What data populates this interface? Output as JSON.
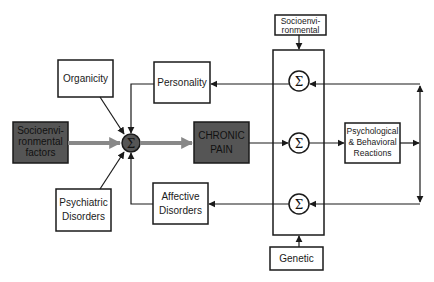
{
  "diagram": {
    "type": "block-diagram",
    "colors": {
      "background": "#ffffff",
      "line": "#1a1a1a",
      "dark_box_fill": "#555555",
      "thick_arrow": "#888888"
    },
    "nodes": {
      "organicity": {
        "lines": [
          "Organicity"
        ]
      },
      "socio_factors": {
        "lines": [
          "Socioenvi-",
          "ronmental",
          "factors"
        ]
      },
      "psychiatric": {
        "lines": [
          "Psychiatric",
          "Disorders"
        ]
      },
      "central_sum": {
        "symbol": "Σ"
      },
      "personality": {
        "lines": [
          "Personality"
        ]
      },
      "chronic_pain": {
        "lines": [
          "CHRONIC",
          "PAIN"
        ]
      },
      "affective": {
        "lines": [
          "Affective",
          "Disorders"
        ]
      },
      "socio_top": {
        "lines": [
          "Socioenvi-",
          "ronmental"
        ]
      },
      "sum_top": {
        "symbol": "Σ"
      },
      "sum_mid": {
        "symbol": "Σ"
      },
      "sum_bottom": {
        "symbol": "Σ"
      },
      "psych_behav": {
        "lines": [
          "Psychological",
          "& Behavioral",
          "Reactions"
        ]
      },
      "genetic": {
        "lines": [
          "Genetic"
        ]
      }
    },
    "edges": [
      {
        "from": "organicity",
        "to": "central_sum"
      },
      {
        "from": "socio_factors",
        "to": "central_sum",
        "style": "thick"
      },
      {
        "from": "psychiatric",
        "to": "central_sum"
      },
      {
        "from": "personality",
        "to": "central_sum"
      },
      {
        "from": "affective",
        "to": "central_sum"
      },
      {
        "from": "central_sum",
        "to": "chronic_pain",
        "style": "thick"
      },
      {
        "from": "chronic_pain",
        "to": "sum_mid"
      },
      {
        "from": "sum_mid",
        "to": "psych_behav"
      },
      {
        "from": "psych_behav",
        "to": "feedback_line"
      },
      {
        "from": "feedback_line",
        "to": "sum_top"
      },
      {
        "from": "feedback_line",
        "to": "sum_bottom"
      },
      {
        "from": "sum_top",
        "to": "personality"
      },
      {
        "from": "sum_bottom",
        "to": "affective"
      },
      {
        "from": "socio_top",
        "to": "modulator_block"
      },
      {
        "from": "genetic",
        "to": "modulator_block"
      }
    ]
  }
}
